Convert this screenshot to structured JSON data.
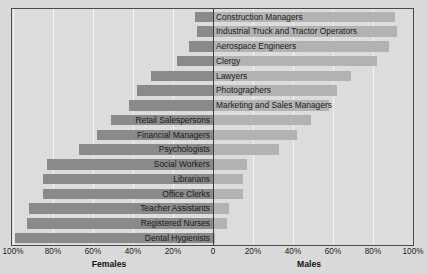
{
  "chart_data": {
    "type": "bar",
    "orientation": "horizontal",
    "subtype": "diverging-population-pyramid",
    "title": "",
    "xlabel": "",
    "ylabel": "",
    "left_axis_label": "Females",
    "right_axis_label": "Males",
    "xlim": [
      -100,
      100
    ],
    "grid": true,
    "legend_position": "none",
    "tick_labels": [
      "100%",
      "80%",
      "60%",
      "40%",
      "20%",
      "0",
      "20%",
      "40%",
      "60%",
      "80%",
      "100%"
    ],
    "tick_values": [
      -100,
      -80,
      -60,
      -40,
      -20,
      0,
      20,
      40,
      60,
      80,
      100
    ],
    "categories": [
      "Construction Managers",
      "Industrial Truck and Tractor Operators",
      "Aerospace Engineers",
      "Clergy",
      "Lawyers",
      "Photographers",
      "Marketing and Sales Managers",
      "Retail Salespersons",
      "Financial Managers",
      "Psychologists",
      "Social Workers",
      "Librarians",
      "Office Clerks",
      "Teacher Assistants",
      "Registered Nurses",
      "Dental Hygienists"
    ],
    "series": [
      {
        "name": "Females",
        "color": "#8a8a8a",
        "values": [
          9,
          8,
          12,
          18,
          31,
          38,
          42,
          51,
          58,
          67,
          83,
          85,
          85,
          92,
          93,
          99
        ]
      },
      {
        "name": "Males",
        "color": "#b2b2b2",
        "values": [
          91,
          92,
          88,
          82,
          69,
          62,
          58,
          49,
          42,
          33,
          17,
          15,
          15,
          8,
          7,
          1
        ]
      }
    ],
    "colors": {
      "female_bar": "#8a8a8a",
      "male_bar": "#b2b2b2",
      "plot_background": "#dcdcdc",
      "page_background": "#d9d9d9",
      "gridline": "#f2f2f2",
      "zero_line": "#3a3a3a",
      "border": "#4a4a4a",
      "text": "#1a1a1a"
    },
    "label_side": [
      "right",
      "right",
      "right",
      "right",
      "right",
      "right",
      "right",
      "left",
      "left",
      "left",
      "left",
      "left",
      "left",
      "left",
      "left",
      "left"
    ]
  }
}
